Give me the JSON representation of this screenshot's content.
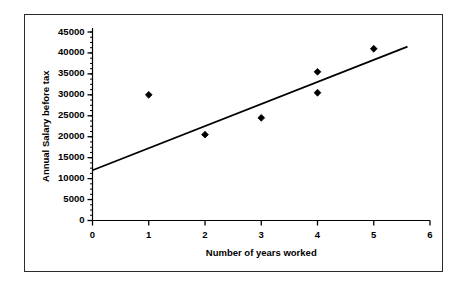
{
  "chart_data": {
    "type": "scatter",
    "title": "",
    "xlabel": "Number of years worked",
    "ylabel": "Annual Salary before tax",
    "xlim": [
      0,
      6
    ],
    "ylim": [
      0,
      45000
    ],
    "xticks": [
      "0",
      "1",
      "2",
      "3",
      "4",
      "5",
      "6"
    ],
    "xtick_values": [
      0,
      1,
      2,
      3,
      4,
      5,
      6
    ],
    "yticks": [
      "0",
      "5000",
      "10000",
      "15000",
      "20000",
      "25000",
      "30000",
      "35000",
      "40000",
      "45000"
    ],
    "ytick_values": [
      0,
      5000,
      10000,
      15000,
      20000,
      25000,
      30000,
      35000,
      40000,
      45000
    ],
    "y_minor_tick_step": 1250,
    "grid": false,
    "legend": false,
    "legend_position": "none",
    "marker": "diamond",
    "marker_color": "#000000",
    "points": [
      {
        "x": 1,
        "y": 30000
      },
      {
        "x": 2,
        "y": 20500
      },
      {
        "x": 3,
        "y": 24500
      },
      {
        "x": 4,
        "y": 35500
      },
      {
        "x": 4,
        "y": 30500
      },
      {
        "x": 5,
        "y": 41000
      }
    ],
    "series": [
      {
        "name": "Salary observations",
        "x": [
          1,
          2,
          3,
          4,
          4,
          5
        ],
        "values": [
          30000,
          20500,
          24500,
          35500,
          30500,
          41000
        ]
      }
    ],
    "trendline": {
      "type": "line",
      "color": "#000000",
      "x_start": 0,
      "y_start": 12000,
      "x_end": 5.6,
      "y_end": 41500
    },
    "axis_color": "#000000",
    "frame_color": "#2b2b2b",
    "background_color": "#ffffff"
  }
}
